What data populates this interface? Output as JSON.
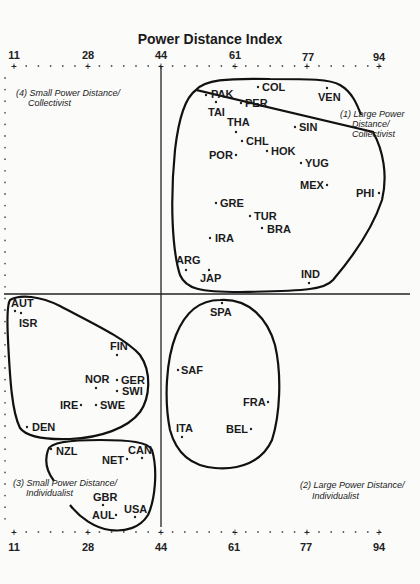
{
  "chart_data": {
    "type": "scatter",
    "title": "Power Distance Index",
    "xlabel": "Power Distance Index",
    "ylabel": "",
    "x_ticks": [
      11,
      28,
      44,
      61,
      77,
      94
    ],
    "xlim": [
      11,
      94
    ],
    "axis_position": "top and bottom",
    "divider_x": 44,
    "grid": false,
    "legend": "none",
    "quadrants": [
      {
        "id": 1,
        "label_line1": "(1) Large Power",
        "label_line2": "Distance/",
        "label_line3": "Collectivist"
      },
      {
        "id": 2,
        "label_line1": "(2) Large Power Distance/",
        "label_line2": "Individualist"
      },
      {
        "id": 3,
        "label_line1": "(3) Small Power Distance/",
        "label_line2": "Individualist"
      },
      {
        "id": 4,
        "label_line1": "(4) Small Power Distance/",
        "label_line2": "Collectivist"
      }
    ],
    "points": [
      {
        "country": "PAK",
        "pdi": 55,
        "cluster": 1,
        "px": 206,
        "py": 95
      },
      {
        "country": "COL",
        "pdi": 67,
        "cluster": 1,
        "px": 258,
        "py": 87
      },
      {
        "country": "VEN",
        "pdi": 81,
        "cluster": 1,
        "px": 327,
        "py": 88
      },
      {
        "country": "TAI",
        "pdi": 58,
        "cluster": 1,
        "px": 216,
        "py": 102
      },
      {
        "country": "PER",
        "pdi": 64,
        "cluster": 1,
        "px": 241,
        "py": 103
      },
      {
        "country": "THA",
        "pdi": 64,
        "cluster": 1,
        "px": 236,
        "py": 132
      },
      {
        "country": "SIN",
        "pdi": 74,
        "cluster": 1,
        "px": 295,
        "py": 127
      },
      {
        "country": "CHL",
        "pdi": 63,
        "cluster": 1,
        "px": 242,
        "py": 141
      },
      {
        "country": "POR",
        "pdi": 63,
        "cluster": 1,
        "px": 236,
        "py": 155
      },
      {
        "country": "HOK",
        "pdi": 68,
        "cluster": 1,
        "px": 267,
        "py": 151
      },
      {
        "country": "YUG",
        "pdi": 76,
        "cluster": 1,
        "px": 301,
        "py": 163
      },
      {
        "country": "MEX",
        "pdi": 81,
        "cluster": 1,
        "px": 327,
        "py": 185
      },
      {
        "country": "PHI",
        "pdi": 94,
        "cluster": 1,
        "px": 379,
        "py": 193
      },
      {
        "country": "GRE",
        "pdi": 60,
        "cluster": 1,
        "px": 216,
        "py": 203
      },
      {
        "country": "TUR",
        "pdi": 66,
        "cluster": 1,
        "px": 250,
        "py": 216
      },
      {
        "country": "BRA",
        "pdi": 69,
        "cluster": 1,
        "px": 262,
        "py": 228
      },
      {
        "country": "IRA",
        "pdi": 58,
        "cluster": 1,
        "px": 210,
        "py": 238
      },
      {
        "country": "ARG",
        "pdi": 49,
        "cluster": 1,
        "px": 186,
        "py": 270
      },
      {
        "country": "JAP",
        "pdi": 54,
        "cluster": 1,
        "px": 209,
        "py": 270
      },
      {
        "country": "IND",
        "pdi": 77,
        "cluster": 1,
        "px": 309,
        "py": 283
      },
      {
        "country": "AUT",
        "pdi": 11,
        "cluster": 3,
        "px": 14,
        "py": 311
      },
      {
        "country": "ISR",
        "pdi": 13,
        "cluster": 3,
        "px": 21,
        "py": 313
      },
      {
        "country": "FIN",
        "pdi": 33,
        "cluster": 3,
        "px": 117,
        "py": 355
      },
      {
        "country": "NOR",
        "pdi": 31,
        "cluster": 3,
        "px": 96,
        "py": 388
      },
      {
        "country": "GER",
        "pdi": 35,
        "cluster": 3,
        "px": 117,
        "py": 380
      },
      {
        "country": "SWI",
        "pdi": 34,
        "cluster": 3,
        "px": 117,
        "py": 391
      },
      {
        "country": "IRE",
        "pdi": 28,
        "cluster": 3,
        "px": 81,
        "py": 405
      },
      {
        "country": "SWE",
        "pdi": 31,
        "cluster": 3,
        "px": 96,
        "py": 405
      },
      {
        "country": "DEN",
        "pdi": 18,
        "cluster": 3,
        "px": 27,
        "py": 427
      },
      {
        "country": "NZL",
        "pdi": 22,
        "cluster": 3,
        "px": 51,
        "py": 449
      },
      {
        "country": "CAN",
        "pdi": 39,
        "cluster": 3,
        "px": 142,
        "py": 458
      },
      {
        "country": "NET",
        "pdi": 38,
        "cluster": 3,
        "px": 127,
        "py": 459
      },
      {
        "country": "GBR",
        "pdi": 35,
        "cluster": 3,
        "px": 103,
        "py": 505
      },
      {
        "country": "AUL",
        "pdi": 36,
        "cluster": 3,
        "px": 116,
        "py": 515
      },
      {
        "country": "USA",
        "pdi": 40,
        "cluster": 3,
        "px": 135,
        "py": 517
      },
      {
        "country": "SPA",
        "pdi": 57,
        "cluster": 2,
        "px": 222,
        "py": 303
      },
      {
        "country": "SAF",
        "pdi": 49,
        "cluster": 2,
        "px": 178,
        "py": 370
      },
      {
        "country": "FRA",
        "pdi": 68,
        "cluster": 2,
        "px": 268,
        "py": 402
      },
      {
        "country": "ITA",
        "pdi": 50,
        "cluster": 2,
        "px": 182,
        "py": 437
      },
      {
        "country": "BEL",
        "pdi": 65,
        "cluster": 2,
        "px": 251,
        "py": 429
      }
    ]
  },
  "title": "Power Distance Index",
  "axis": {
    "top_ticks": [
      "11",
      "28",
      "44",
      "61",
      "77",
      "94"
    ],
    "bottom_ticks": [
      "11",
      "28",
      "44",
      "61",
      "77",
      "94"
    ]
  },
  "quadrant_labels": {
    "q1": {
      "line1": "(1) Large Power",
      "line2": "Distance/",
      "line3": "Collectivist"
    },
    "q2": {
      "line1": "(2) Large Power Distance/",
      "line2": "Individualist"
    },
    "q3": {
      "line1": "(3) Small Power Distance/",
      "line2": "Individualist"
    },
    "q4": {
      "line1": "(4) Small Power Distance/",
      "line2": "Collectivist"
    }
  },
  "countries": {
    "PAK": "PAK",
    "COL": "COL",
    "VEN": "VEN",
    "TAI": "TAI",
    "PER": "PER",
    "THA": "THA",
    "SIN": "SIN",
    "CHL": "CHL",
    "POR": "POR",
    "HOK": "HOK",
    "YUG": "YUG",
    "MEX": "MEX",
    "PHI": "PHI",
    "GRE": "GRE",
    "TUR": "TUR",
    "BRA": "BRA",
    "IRA": "IRA",
    "ARG": "ARG",
    "JAP": "JAP",
    "IND": "IND",
    "AUT": "AUT",
    "ISR": "ISR",
    "FIN": "FIN",
    "NOR": "NOR",
    "GER": "GER",
    "SWI": "SWI",
    "IRE": "IRE",
    "SWE": "SWE",
    "DEN": "DEN",
    "NZL": "NZL",
    "CAN": "CAN",
    "NET": "NET",
    "GBR": "GBR",
    "AUL": "AUL",
    "USA": "USA",
    "SPA": "SPA",
    "SAF": "SAF",
    "FRA": "FRA",
    "ITA": "ITA",
    "BEL": "BEL"
  }
}
